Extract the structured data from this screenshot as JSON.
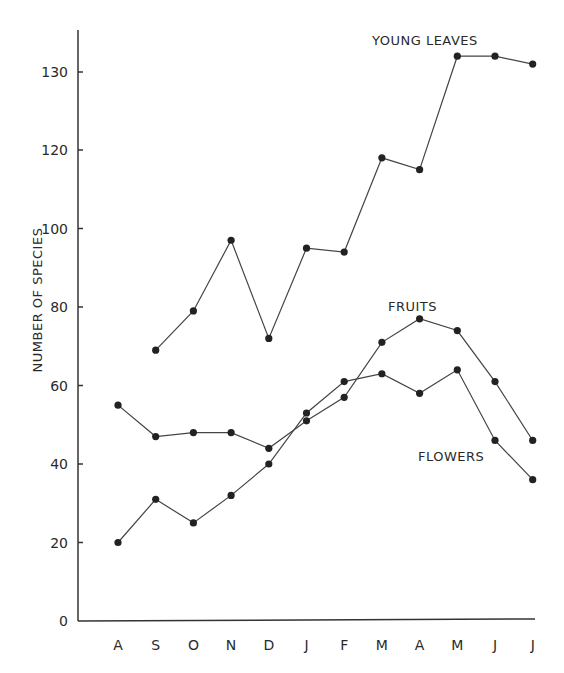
{
  "chart_data": {
    "type": "line",
    "title": "",
    "xlabel": "",
    "ylabel": "NUMBER OF SPECIES",
    "categories": [
      "A",
      "S",
      "O",
      "N",
      "D",
      "J",
      "F",
      "M",
      "A",
      "M",
      "J",
      "J"
    ],
    "y_ticks": [
      0,
      20,
      40,
      60,
      80,
      100,
      120,
      130
    ],
    "ylim": [
      0,
      135
    ],
    "grid": false,
    "legend_position": "inline labels",
    "series": [
      {
        "name": "YOUNG LEAVES",
        "values": [
          null,
          69,
          79,
          97,
          72,
          95,
          94,
          118,
          115,
          132,
          132,
          131
        ]
      },
      {
        "name": "FRUITS",
        "values": [
          55,
          47,
          48,
          48,
          44,
          51,
          57,
          71,
          77,
          74,
          61,
          46
        ]
      },
      {
        "name": "FLOWERS",
        "values": [
          20,
          31,
          25,
          32,
          40,
          53,
          61,
          63,
          58,
          64,
          46,
          36
        ]
      }
    ],
    "annotations": [
      {
        "text": "YOUNG LEAVES",
        "near": "top right"
      },
      {
        "text": "FRUITS",
        "near": "April peak of fruits"
      },
      {
        "text": "FLOWERS",
        "near": "lower right"
      }
    ]
  },
  "labels": {
    "ylabel": "NUMBER OF SPECIES",
    "young_leaves": "YOUNG LEAVES",
    "fruits": "FRUITS",
    "flowers": "FLOWERS"
  },
  "layout": {
    "x_positions": [
      118,
      155.7,
      193.4,
      231.1,
      268.8,
      306.5,
      344.2,
      381.9,
      419.6,
      457.3,
      495,
      532.7
    ],
    "y_zero": 621,
    "px_per_unit_low": 3.925,
    "y_120": 151,
    "px_per_unit_high": 7.9
  }
}
